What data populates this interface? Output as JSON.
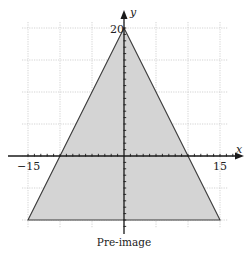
{
  "diagram": {
    "caption": "Pre-image",
    "axes": {
      "x_label": "x",
      "y_label": "y",
      "x_tick_labels": [
        {
          "value": -15,
          "text": "−15"
        },
        {
          "value": 15,
          "text": "15"
        }
      ],
      "y_tick_labels": [
        {
          "value": 20,
          "text": "20"
        }
      ],
      "grid_spacing": 5,
      "tick_spacing": 1,
      "x_range": [
        -16,
        18
      ],
      "y_range": [
        -11,
        21
      ]
    },
    "shape": {
      "type": "triangle",
      "vertices": [
        {
          "x": 0,
          "y": 20
        },
        {
          "x": -15,
          "y": -10
        },
        {
          "x": 15,
          "y": -10
        }
      ],
      "fill": "#d4d4d4",
      "stroke": "#3a3a3a"
    }
  }
}
